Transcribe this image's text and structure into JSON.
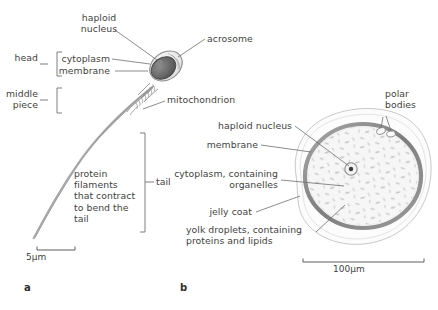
{
  "figure": {
    "background": "#ffffff",
    "ink": "#3f3f3f",
    "membrane_color": "#8a8a8a",
    "nucleus_color": "#555555",
    "cytoplasm_color": "#f4f4f4",
    "jelly_color": "#fbfbfb"
  },
  "panels": [
    {
      "id": "a",
      "label": "a",
      "subject": "sperm cell"
    },
    {
      "id": "b",
      "label": "b",
      "subject": "egg cell"
    }
  ],
  "sperm": {
    "brackets": [
      {
        "name": "head",
        "label": "head"
      },
      {
        "name": "middle-piece",
        "label": "middle\npiece"
      },
      {
        "name": "tail",
        "label": "tail"
      }
    ],
    "labels": [
      {
        "name": "haploid-nucleus",
        "label": "haploid\nnucleus"
      },
      {
        "name": "cytoplasm",
        "label": "cytoplasm"
      },
      {
        "name": "membrane",
        "label": "membrane"
      },
      {
        "name": "acrosome",
        "label": "acrosome"
      },
      {
        "name": "mitochondrion",
        "label": "mitochondrion"
      },
      {
        "name": "protein-filaments",
        "label": "protein\nfilaments\nthat contract\nto bend the\ntail"
      }
    ],
    "scale_bar": {
      "label": "5µm",
      "value": 5,
      "unit": "µm"
    }
  },
  "egg": {
    "labels": [
      {
        "name": "haploid-nucleus",
        "label": "haploid nucleus"
      },
      {
        "name": "membrane",
        "label": "membrane"
      },
      {
        "name": "cytoplasm",
        "label": "cytoplasm, containing\norganelles"
      },
      {
        "name": "jelly-coat",
        "label": "jelly coat"
      },
      {
        "name": "yolk-droplets",
        "label": "yolk droplets, containing\nproteins and lipids"
      },
      {
        "name": "polar-bodies",
        "label": "polar\nbodies"
      }
    ],
    "scale_bar": {
      "label": "100µm",
      "value": 100,
      "unit": "µm"
    }
  }
}
